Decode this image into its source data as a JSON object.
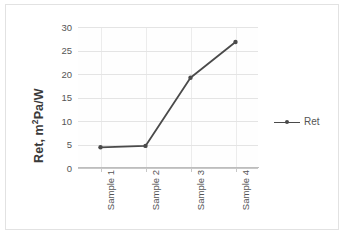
{
  "chart_data": {
    "type": "line",
    "title": "",
    "xlabel": "",
    "ylabel": "Ret, m²Pa/W",
    "ylabel_base": "Ret, m",
    "ylabel_sup": "2",
    "ylabel_tail": "Pa/W",
    "categories": [
      "Sample 1",
      "Sample 2",
      "Sample 3",
      "Sample 4"
    ],
    "series": [
      {
        "name": "Ret",
        "values": [
          4.4,
          4.7,
          19.2,
          26.8
        ]
      }
    ],
    "ylim": [
      0,
      30
    ],
    "yticks": [
      0,
      5,
      10,
      15,
      20,
      25,
      30
    ],
    "ytick_labels": [
      "0",
      "5",
      "10",
      "15",
      "20",
      "25",
      "30"
    ],
    "grid": {
      "horizontal": true,
      "vertical": true
    },
    "legend": {
      "position": "right",
      "entries": [
        "Ret"
      ]
    },
    "colors": {
      "series": "#4a4a4a",
      "grid": "#e4e4e4",
      "axis": "#bdbdbd",
      "text": "#555555",
      "border": "#e2e2e2",
      "plot_background": "#fefefe"
    },
    "marker": "circle"
  },
  "legend": {
    "label": "Ret"
  }
}
